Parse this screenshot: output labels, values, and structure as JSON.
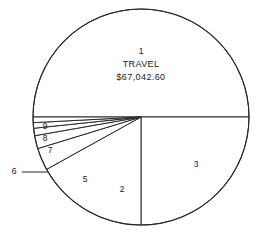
{
  "chart_data": {
    "type": "pie",
    "title": "",
    "center_label": {
      "number": "1",
      "name": "TRAVEL",
      "value": "$67,042.60"
    },
    "geometry": {
      "cx": 141,
      "cy": 117,
      "r": 108,
      "start_angle_deg": 180,
      "direction": "clockwise-from-left"
    },
    "categories": [
      "1",
      "2",
      "3",
      "5",
      "6",
      "7",
      "8",
      "9"
    ],
    "labels": [
      "1",
      "2",
      "3",
      "5",
      "6",
      "7",
      "8",
      "9"
    ],
    "values": [
      50.0,
      14.0,
      25.0,
      4.5,
      2.0,
      1.8,
      1.4,
      1.3
    ],
    "slices": [
      {
        "label": "1",
        "name": "TRAVEL",
        "value_text": "$67,042.60",
        "percent": 50.0,
        "a0": 180,
        "a1": 360,
        "label_x": 141,
        "label_y": 62,
        "label_inside": true
      },
      {
        "label": "3",
        "percent": 25.0,
        "a0": 0,
        "a1": 90,
        "label_x": 196,
        "label_y": 165,
        "label_inside": true
      },
      {
        "label": "2",
        "percent": 14.0,
        "a0": 90,
        "a1": 151,
        "label_x": 122,
        "label_y": 190,
        "label_inside": true
      },
      {
        "label": "5",
        "percent": 4.5,
        "a0": 151,
        "a1": 163,
        "label_x": 85,
        "label_y": 180,
        "label_inside": true
      },
      {
        "label": "6",
        "percent": 2.0,
        "a0": 163,
        "a1": 170,
        "label_x": 14,
        "label_y": 172,
        "label_inside": false,
        "leader_x1": 22,
        "leader_y1": 172,
        "leader_x2": 48,
        "leader_y2": 172
      },
      {
        "label": "7",
        "percent": 1.8,
        "a0": 170,
        "a1": 174,
        "label_x": 50,
        "label_y": 151,
        "label_inside": true
      },
      {
        "label": "8",
        "percent": 1.4,
        "a0": 174,
        "a1": 177,
        "label_x": 45,
        "label_y": 139,
        "label_inside": true
      },
      {
        "label": "9",
        "percent": 1.3,
        "a0": 177,
        "a1": 180,
        "label_x": 45,
        "label_y": 127,
        "label_inside": true
      }
    ],
    "colors": {
      "background": "#ffffff",
      "slice_fill": "#ffffff",
      "outline": "#2b2b2b",
      "text": "#1a1a1a"
    },
    "legend": "none",
    "grid": false
  }
}
